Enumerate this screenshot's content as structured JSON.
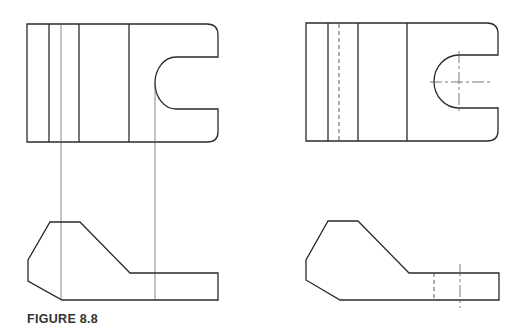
{
  "figure": {
    "caption": "FIGURE 8.8"
  },
  "colors": {
    "background": "#ffffff",
    "line": "#2a2a2a"
  },
  "views": [
    {
      "id": "left-top-view",
      "type": "top view",
      "features": [
        "vertical edges",
        "U-slot with rounded corners",
        "projection lines"
      ]
    },
    {
      "id": "left-front-view",
      "type": "front view",
      "features": [
        "chamfered profile",
        "projection lines"
      ]
    },
    {
      "id": "right-top-view",
      "type": "top view",
      "features": [
        "vertical edges",
        "hidden line",
        "U-slot",
        "center lines"
      ]
    },
    {
      "id": "right-front-view",
      "type": "front view",
      "features": [
        "chamfered profile",
        "hidden line",
        "center line"
      ]
    }
  ]
}
